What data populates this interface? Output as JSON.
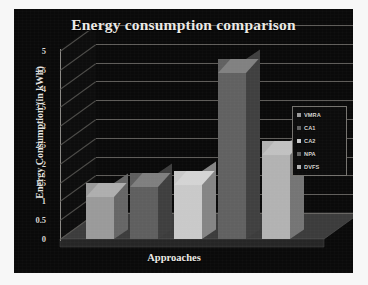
{
  "chart_data": {
    "type": "bar",
    "title": "Energy consumption comparison",
    "xlabel": "Approaches",
    "ylabel": "Energy Consumption (in kWh)",
    "categories": [
      "VMRA",
      "CA1",
      "CA2",
      "NPA",
      "DVFS"
    ],
    "values": [
      1.5,
      1.75,
      1.8,
      4.8,
      2.6
    ],
    "ylim": [
      0,
      5
    ],
    "yticks": [
      "0",
      "0.5",
      "1",
      "1.5",
      "2",
      "2.5",
      "3",
      "3.5",
      "4",
      "4.5",
      "5"
    ],
    "grid": true,
    "legend_position": "right",
    "style": "3d-column",
    "series": [
      {
        "name": "Energy Consumption (in kWh)",
        "values": [
          1.5,
          1.75,
          1.8,
          4.8,
          2.6
        ]
      }
    ],
    "bar_colors": [
      "#9a9a9a",
      "#5f5f5f",
      "#c9c9c9",
      "#616161",
      "#b2b2b2"
    ],
    "legend": [
      {
        "label": "VMRA",
        "color": "#9a9a9a"
      },
      {
        "label": "CA1",
        "color": "#5f5f5f"
      },
      {
        "label": "CA2",
        "color": "#c9c9c9"
      },
      {
        "label": "NPA",
        "color": "#616161"
      },
      {
        "label": "DVFS",
        "color": "#b2b2b2"
      }
    ]
  },
  "colors": {
    "panel_background": "#0a0a0a",
    "page_background": "#f7f7f7",
    "gridline": "#6e6c68",
    "text": "#eceae6",
    "floor": "#3a3a3a"
  }
}
